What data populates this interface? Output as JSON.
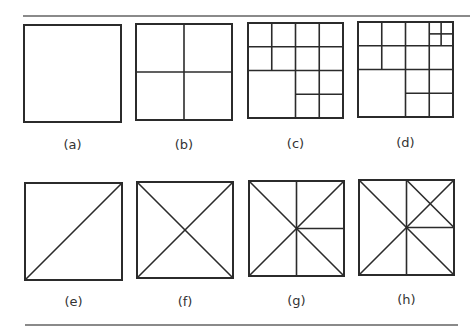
{
  "figure": {
    "top_rule": {
      "x1": 23,
      "x2": 470,
      "y": 15
    },
    "bottom_rule": {
      "x1": 25,
      "x2": 458,
      "y": 324
    },
    "stroke_color": "#2b2b2b",
    "panels": [
      {
        "id": "a",
        "label": "(a)",
        "x": 24,
        "y": 25,
        "size": 97,
        "label_y": 137,
        "lines": []
      },
      {
        "id": "b",
        "label": "(b)",
        "x": 136,
        "y": 24,
        "size": 96,
        "label_y": 137,
        "lines": [
          [
            0.5,
            0,
            0.5,
            1
          ],
          [
            0,
            0.5,
            1,
            0.5
          ]
        ]
      },
      {
        "id": "c",
        "label": "(c)",
        "x": 248,
        "y": 23,
        "size": 95,
        "label_y": 136,
        "lines": [
          [
            0,
            0.25,
            1,
            0.25
          ],
          [
            0,
            0.5,
            1,
            0.5
          ],
          [
            0.5,
            0.75,
            1,
            0.75
          ],
          [
            0.25,
            0,
            0.25,
            0.5
          ],
          [
            0.5,
            0,
            0.5,
            1
          ],
          [
            0.75,
            0,
            0.75,
            1
          ]
        ]
      },
      {
        "id": "d",
        "label": "(d)",
        "x": 358,
        "y": 22,
        "size": 95,
        "label_y": 135,
        "lines": [
          [
            0,
            0.25,
            1,
            0.25
          ],
          [
            0,
            0.5,
            1,
            0.5
          ],
          [
            0.5,
            0.75,
            1,
            0.75
          ],
          [
            0.25,
            0,
            0.25,
            0.5
          ],
          [
            0.5,
            0,
            0.5,
            1
          ],
          [
            0.75,
            0,
            0.75,
            1
          ],
          [
            0.875,
            0,
            0.875,
            0.25
          ],
          [
            0.75,
            0.125,
            1,
            0.125
          ]
        ]
      },
      {
        "id": "e",
        "label": "(e)",
        "x": 25,
        "y": 183,
        "size": 97,
        "label_y": 294,
        "lines": [
          [
            0,
            1,
            1,
            0
          ]
        ]
      },
      {
        "id": "f",
        "label": "(f)",
        "x": 137,
        "y": 182,
        "size": 96,
        "label_y": 294,
        "lines": [
          [
            0,
            0,
            1,
            1
          ],
          [
            0,
            1,
            1,
            0
          ]
        ]
      },
      {
        "id": "g",
        "label": "(g)",
        "x": 249,
        "y": 181,
        "size": 95,
        "label_y": 293,
        "lines": [
          [
            0,
            0,
            1,
            1
          ],
          [
            0,
            1,
            1,
            0
          ],
          [
            0.5,
            0,
            0.5,
            1
          ],
          [
            0.5,
            0.5,
            1,
            0.5
          ]
        ]
      },
      {
        "id": "h",
        "label": "(h)",
        "x": 359,
        "y": 180,
        "size": 95,
        "label_y": 292,
        "lines": [
          [
            0,
            0,
            1,
            1
          ],
          [
            0,
            1,
            1,
            0
          ],
          [
            0.5,
            0,
            0.5,
            1
          ],
          [
            0.5,
            0.5,
            1,
            0.5
          ],
          [
            0.5,
            0,
            1,
            0.5
          ]
        ]
      }
    ]
  }
}
